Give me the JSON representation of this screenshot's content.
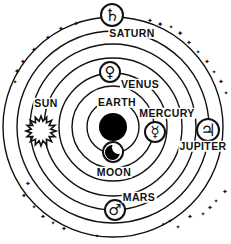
{
  "figure": {
    "type": "geocentric-model-diagram",
    "background": "#ffffff",
    "ink": "#111111",
    "center": {
      "x": 113,
      "y": 127
    },
    "orbit_radii": [
      26,
      41,
      54,
      69,
      83,
      96,
      110
    ],
    "earth": {
      "label": "EARTH",
      "x": 113,
      "y": 127,
      "r": 14,
      "label_x": 117,
      "label_y": 102
    },
    "bodies": [
      {
        "name": "moon",
        "label": "MOON",
        "glyph": "crescent",
        "x": 113,
        "y": 152,
        "r": 11,
        "label_x": 114,
        "label_y": 172
      },
      {
        "name": "mercury",
        "label": "MERCURY",
        "glyph": "☿",
        "x": 155,
        "y": 132,
        "r": 11,
        "label_x": 167,
        "label_y": 113
      },
      {
        "name": "venus",
        "label": "VENUS",
        "glyph": "♀",
        "x": 110,
        "y": 72,
        "r": 11,
        "label_x": 140,
        "label_y": 84
      },
      {
        "name": "sun",
        "label": "SUN",
        "glyph": "sunburst",
        "x": 41,
        "y": 131,
        "r": 15,
        "label_x": 46,
        "label_y": 103
      },
      {
        "name": "mars",
        "label": "MARS",
        "glyph": "♂",
        "x": 115,
        "y": 210,
        "r": 11,
        "label_x": 139,
        "label_y": 197
      },
      {
        "name": "jupiter",
        "label": "JUPITER",
        "glyph": "♃",
        "x": 208,
        "y": 130,
        "r": 12,
        "label_x": 203,
        "label_y": 146
      },
      {
        "name": "saturn",
        "label": "SATURN",
        "glyph": "♄",
        "x": 112,
        "y": 15,
        "r": 12,
        "label_x": 132,
        "label_y": 33
      }
    ],
    "star_glyph": "✦",
    "stars": [
      [
        76,
        24,
        7
      ],
      [
        61,
        29,
        7
      ],
      [
        48,
        38,
        7
      ],
      [
        34,
        50,
        7
      ],
      [
        23,
        62,
        7
      ],
      [
        17,
        72,
        8
      ],
      [
        15,
        82,
        6
      ],
      [
        150,
        21,
        7
      ],
      [
        160,
        25,
        8
      ],
      [
        171,
        27,
        6
      ],
      [
        180,
        34,
        8
      ],
      [
        189,
        43,
        7
      ],
      [
        198,
        52,
        6
      ],
      [
        207,
        62,
        7
      ],
      [
        214,
        72,
        6
      ],
      [
        221,
        82,
        7
      ],
      [
        226,
        93,
        6
      ],
      [
        28,
        184,
        7
      ],
      [
        24,
        196,
        7
      ],
      [
        34,
        207,
        6
      ],
      [
        43,
        217,
        7
      ],
      [
        53,
        223,
        6
      ],
      [
        64,
        229,
        7
      ],
      [
        97,
        236,
        6
      ],
      [
        163,
        224,
        5
      ],
      [
        170,
        221,
        6
      ],
      [
        178,
        227,
        6
      ],
      [
        190,
        217,
        7
      ],
      [
        203,
        214,
        6
      ],
      [
        210,
        208,
        7
      ],
      [
        216,
        201,
        6
      ],
      [
        225,
        192,
        7
      ]
    ]
  }
}
